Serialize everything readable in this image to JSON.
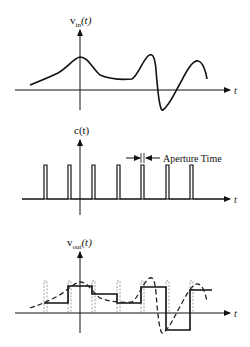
{
  "panels": {
    "input": {
      "ylabel_main": "v",
      "ylabel_sub": "in",
      "ylabel_arg": "(t)",
      "xlabel": "t"
    },
    "clock": {
      "ylabel": "c(t)",
      "xlabel": "t",
      "annotation": "Aperture Time"
    },
    "output": {
      "ylabel_main": "v",
      "ylabel_sub": "out",
      "ylabel_arg": "(t)",
      "xlabel": "t"
    }
  },
  "colors": {
    "stroke": "#111111",
    "dashed": "#333333",
    "pulse_dashed": "#999999"
  }
}
